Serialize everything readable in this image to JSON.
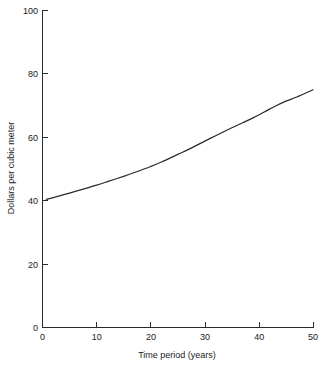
{
  "chart_data": {
    "type": "line",
    "title": "",
    "xlabel": "Time period (years)",
    "ylabel": "Dollars per cubic meter",
    "xlim": [
      0,
      50
    ],
    "ylim": [
      0,
      100
    ],
    "xticks": [
      0,
      10,
      20,
      30,
      40,
      50
    ],
    "yticks": [
      0,
      20,
      40,
      60,
      80,
      100
    ],
    "xtick_labels": [
      "0",
      "10",
      "20",
      "30",
      "40",
      "50"
    ],
    "ytick_labels": [
      "0",
      "20",
      "40",
      "60",
      "80",
      "100"
    ],
    "grid": false,
    "legend": false,
    "legend_position": "none",
    "line_color": "#2b2b2b",
    "background_color": "#ffffff",
    "series": [
      {
        "name": "Dollars per cubic meter",
        "x": [
          0.7,
          2,
          5,
          8,
          10,
          12,
          15,
          17,
          20,
          22,
          25,
          27,
          30,
          32,
          35,
          37,
          39,
          41,
          43,
          45,
          47,
          50
        ],
        "values": [
          40.4,
          41.0,
          42.4,
          43.9,
          44.9,
          46.0,
          47.7,
          48.9,
          50.8,
          52.2,
          54.6,
          56.2,
          58.8,
          60.5,
          63.0,
          64.6,
          66.2,
          68.0,
          69.8,
          71.4,
          72.7,
          75.0
        ]
      }
    ]
  },
  "axis": {
    "y_title": "Dollars per cubic meter",
    "x_title": "Time period (years)"
  }
}
